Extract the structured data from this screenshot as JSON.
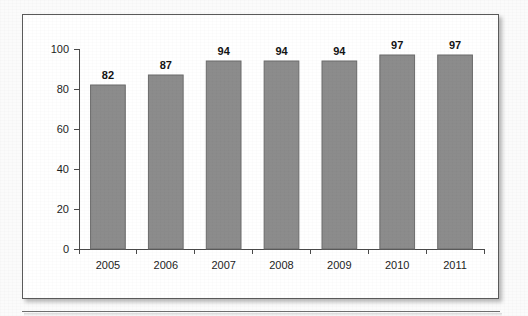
{
  "chart_data": {
    "type": "bar",
    "title": "",
    "subtitle": "",
    "xlabel": "",
    "ylabel": "",
    "categories": [
      "2005",
      "2006",
      "2007",
      "2008",
      "2009",
      "2010",
      "2011"
    ],
    "values": [
      82,
      87,
      94,
      94,
      94,
      97,
      97
    ],
    "value_labels": [
      "82",
      "87",
      "94",
      "94",
      "94",
      "97",
      "97"
    ],
    "ylim": [
      0,
      100
    ],
    "ytick_values": [
      0,
      20,
      40,
      60,
      80,
      100
    ],
    "ytick_labels": [
      "0",
      "20",
      "40",
      "60",
      "80",
      "100"
    ],
    "grid": false,
    "legend": null,
    "legend_position": "none",
    "bar_color": "#8c8c8c",
    "bar_border_color": "#6b6b6b",
    "axis_color": "#4a4a4a",
    "text_color": "#1d1d1d",
    "plot_background": "#ffffff"
  },
  "card": {
    "border_color": "#5a5a5a",
    "background": "#ffffff"
  },
  "page": {
    "background": "#fbfbfb",
    "rule_color": "#6e6e6e"
  }
}
